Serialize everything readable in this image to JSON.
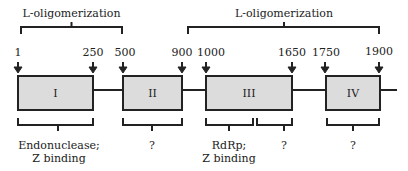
{
  "diagram": {
    "type": "protein-domain-map",
    "colors": {
      "box_fill": "#dcdcdc",
      "stroke": "#222222",
      "background": "#ffffff"
    },
    "top_brackets": [
      {
        "label": "L-oligomerization",
        "x1": 21,
        "x2": 122
      },
      {
        "label": "L-oligomerization",
        "x1": 188,
        "x2": 379
      }
    ],
    "positions": [
      {
        "label": "1",
        "x": 18
      },
      {
        "label": "250",
        "x": 93
      },
      {
        "label": "500",
        "x": 123
      },
      {
        "label": "900",
        "x": 182
      },
      {
        "label": "1000",
        "x": 206
      },
      {
        "label": "1650",
        "x": 292
      },
      {
        "label": "1750",
        "x": 326
      },
      {
        "label": "1900",
        "x": 380
      }
    ],
    "domains": [
      {
        "label": "I",
        "x1": 18,
        "x2": 93
      },
      {
        "label": "II",
        "x1": 123,
        "x2": 182
      },
      {
        "label": "III",
        "x1": 206,
        "x2": 292
      },
      {
        "label": "IV",
        "x1": 326,
        "x2": 380
      }
    ],
    "bottom_brackets": [
      {
        "x1": 18,
        "x2": 93,
        "lines": [
          "Endonuclease;",
          "Z binding"
        ]
      },
      {
        "x1": 123,
        "x2": 182,
        "lines": [
          "?"
        ]
      },
      {
        "x1": 206,
        "x2": 254,
        "lines": [
          "RdRp;",
          "Z binding"
        ]
      },
      {
        "x1": 257,
        "x2": 292,
        "lines": [
          "?"
        ]
      },
      {
        "x1": 326,
        "x2": 380,
        "lines": [
          "?"
        ]
      }
    ]
  },
  "labels": {
    "top_left": "L-oligomerization",
    "top_right": "L-oligomerization",
    "pos_1": "1",
    "pos_250": "250",
    "pos_500": "500",
    "pos_900": "900",
    "pos_1000": "1000",
    "pos_1650": "1650",
    "pos_1750": "1750",
    "pos_1900": "1900",
    "domain_1": "I",
    "domain_2": "II",
    "domain_3": "III",
    "domain_4": "IV",
    "func_1a": "Endonuclease;",
    "func_1b": "Z binding",
    "func_2": "?",
    "func_3a": "RdRp;",
    "func_3b": "Z binding",
    "func_4": "?",
    "func_5": "?"
  }
}
